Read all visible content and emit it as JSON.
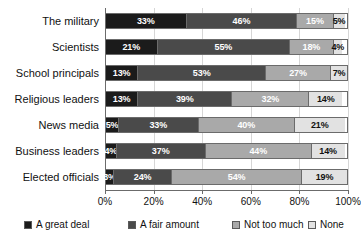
{
  "chart_data": {
    "type": "bar",
    "orientation": "horizontal",
    "stacked": true,
    "stack_total": 100,
    "title": "",
    "subtitle": "",
    "xlabel": "",
    "ylabel": "",
    "xlim": [
      0,
      100
    ],
    "xticks": [
      "0%",
      "20%",
      "40%",
      "60%",
      "80%",
      "100%"
    ],
    "xtick_values": [
      0,
      20,
      40,
      60,
      80,
      100
    ],
    "grid": true,
    "legend_position": "bottom",
    "categories": [
      "The military",
      "Scientists",
      "School principals",
      "Religious leaders",
      "News media",
      "Business leaders",
      "Elected officials"
    ],
    "series": [
      {
        "name": "A great deal",
        "color": "#1b1b1b",
        "values": [
          33,
          21,
          13,
          13,
          5,
          4,
          3
        ],
        "labels": [
          "33%",
          "21%",
          "13%",
          "13%",
          "5%",
          "4%",
          "3%"
        ]
      },
      {
        "name": "A fair amount",
        "color": "#4a4a4a",
        "values": [
          46,
          55,
          53,
          39,
          33,
          37,
          24
        ],
        "labels": [
          "46%",
          "55%",
          "53%",
          "39%",
          "33%",
          "37%",
          "24%"
        ]
      },
      {
        "name": "Not too much",
        "color": "#a9a9a9",
        "values": [
          15,
          18,
          27,
          32,
          40,
          44,
          54
        ],
        "labels": [
          "15%",
          "18%",
          "27%",
          "32%",
          "40%",
          "44%",
          "54%"
        ]
      },
      {
        "name": "None",
        "color": "#e2e2e2",
        "values": [
          5,
          4,
          7,
          14,
          21,
          14,
          19
        ],
        "labels": [
          "5%",
          "4%",
          "7%",
          "14%",
          "21%",
          "14%",
          "19%"
        ]
      }
    ]
  }
}
